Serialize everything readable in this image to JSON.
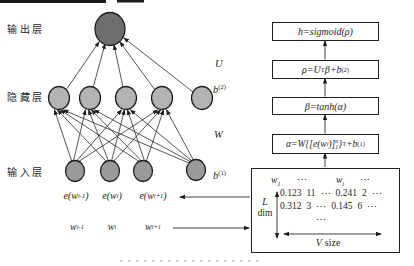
{
  "figure": {
    "layer_labels": {
      "output": "输出层",
      "hidden": "隐藏层",
      "input": "输入层"
    },
    "weight_labels": {
      "U": "U",
      "W": "W",
      "b2": {
        "base": "b",
        "sup": "(2)"
      },
      "b1": {
        "base": "b",
        "sup": "(1)"
      }
    },
    "formulas": {
      "f1": "h=sigmoid(ρ)",
      "f2": {
        "p1": "ρ=U",
        "sup1": "T",
        "p2": "β+b",
        "sup2": "(2)"
      },
      "f3": "β=tanh(α)",
      "f4": {
        "p1": "α=W{[e(w",
        "sub1": "i",
        "p2": ")]",
        "stack_top": "n",
        "stack_bot": "1",
        "p3": "}",
        "sup3": "T",
        "p4": "+b",
        "sup4": "(1)"
      }
    },
    "embedding_labels": [
      {
        "pre": "e(w",
        "sub": "i-1",
        "post": ")"
      },
      {
        "pre": "e(w",
        "sub": "i",
        "post": ")"
      },
      {
        "pre": "e(w",
        "sub": "i+1",
        "post": ")"
      }
    ],
    "word_labels": [
      {
        "pre": "w",
        "sub": "i-1"
      },
      {
        "pre": "w",
        "sub": "i"
      },
      {
        "pre": "w",
        "sub": "i+1"
      }
    ],
    "lookup_table": {
      "headers": [
        {
          "pre": "w",
          "sub": "1"
        },
        {
          "dots": "⋯"
        },
        {
          "pre": "w",
          "sub": "i"
        },
        {
          "dots": "⋯"
        }
      ],
      "rows": [
        [
          "0.123",
          "11",
          "⋯",
          "0.241",
          "2",
          "⋯"
        ],
        [
          "0.312",
          "3",
          "⋯",
          "0.145",
          "6",
          "⋯"
        ]
      ],
      "ellipsis_row": "⋯",
      "dim_label": {
        "line1": "L",
        "line2": "dim"
      },
      "size_label": {
        "var": "V",
        "word": "size"
      }
    },
    "colors": {
      "output_node": "#6d6d6d",
      "hidden_node": "#b3b3b3",
      "input_node": "#9a9a9a",
      "stroke": "#1f1f1f"
    }
  }
}
